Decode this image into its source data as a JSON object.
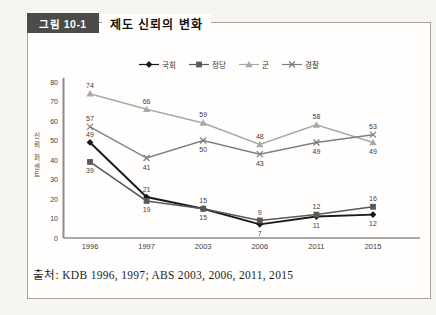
{
  "figure": {
    "tag_label": "그림 10-1",
    "title": "제도 신뢰의 변화",
    "source": "출처: KDB 1996, 1997; ABS 2003, 2006, 2011, 2015"
  },
  "chart_data": {
    "type": "line",
    "title": "제도 신뢰의 변화",
    "categories": [
      "1996",
      "1997",
      "2003",
      "2006",
      "2011",
      "2015"
    ],
    "xlabel": "",
    "ylabel": "신뢰 퍼센트",
    "ylim": [
      0,
      80
    ],
    "ytick_interval": 10,
    "grid": false,
    "legend_position": "top",
    "series": [
      {
        "name": "국회",
        "marker": "diamond",
        "color": "#1a1a1a",
        "values": [
          49,
          21,
          15,
          7,
          11,
          12
        ],
        "label_side": [
          "above",
          "above",
          "above",
          "below",
          "below",
          "below"
        ]
      },
      {
        "name": "정당",
        "marker": "square",
        "color": "#595959",
        "values": [
          39,
          19,
          15,
          9,
          12,
          16
        ],
        "label_side": [
          "below",
          "below",
          "below",
          "above",
          "above",
          "above"
        ]
      },
      {
        "name": "군",
        "marker": "triangle",
        "color": "#a8a8a8",
        "values": [
          74,
          66,
          59,
          48,
          58,
          49
        ],
        "label_side": [
          "above",
          "above",
          "above",
          "above",
          "above",
          "below"
        ]
      },
      {
        "name": "경찰",
        "marker": "x",
        "color": "#7f7f7f",
        "values": [
          57,
          41,
          50,
          43,
          49,
          53
        ],
        "label_side": [
          "above",
          "below",
          "below",
          "below",
          "below",
          "above"
        ]
      }
    ]
  }
}
